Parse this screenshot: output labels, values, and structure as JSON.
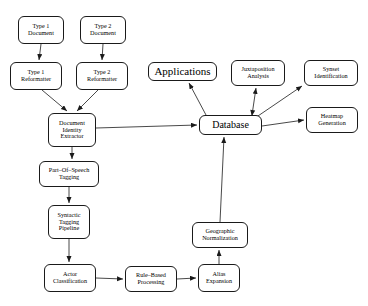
{
  "diagram": {
    "background_color": "#ffffff",
    "stroke_color": "#1a1a1a",
    "nodes": [
      {
        "id": "type1_document",
        "lines": [
          "Type 1",
          "Document"
        ],
        "x": 18,
        "y": 16,
        "w": 46,
        "h": 28,
        "size": "sm"
      },
      {
        "id": "type2_document",
        "lines": [
          "Type 2",
          "Document"
        ],
        "x": 80,
        "y": 16,
        "w": 46,
        "h": 28,
        "size": "sm"
      },
      {
        "id": "type1_reformatter",
        "lines": [
          "Type 1",
          "Reformatter"
        ],
        "x": 10,
        "y": 62,
        "w": 52,
        "h": 28,
        "size": "sm"
      },
      {
        "id": "type2_reformatter",
        "lines": [
          "Type 2",
          "Reformatter"
        ],
        "x": 76,
        "y": 62,
        "w": 52,
        "h": 28,
        "size": "sm"
      },
      {
        "id": "document_identity_extractor",
        "lines": [
          "Document",
          "Identity",
          "Extractor"
        ],
        "x": 48,
        "y": 113,
        "w": 48,
        "h": 34,
        "size": "sm"
      },
      {
        "id": "part_of_speech_tagging",
        "lines": [
          "Part–Of–Speech",
          "Tagging"
        ],
        "x": 39,
        "y": 161,
        "w": 60,
        "h": 26,
        "size": "sm"
      },
      {
        "id": "syntactic_tagging_pipeline",
        "lines": [
          "Syntactic",
          "Tagging",
          "Pipeline"
        ],
        "x": 48,
        "y": 205,
        "w": 42,
        "h": 34,
        "size": "sm"
      },
      {
        "id": "actor_classification",
        "lines": [
          "Actor",
          "Classification"
        ],
        "x": 44,
        "y": 264,
        "w": 52,
        "h": 28,
        "size": "sm"
      },
      {
        "id": "rule_based_processing",
        "lines": [
          "Rule–Based",
          "Processing"
        ],
        "x": 125,
        "y": 266,
        "w": 52,
        "h": 26,
        "size": "sm"
      },
      {
        "id": "alias_expansion",
        "lines": [
          "Alias",
          "Expansion"
        ],
        "x": 198,
        "y": 264,
        "w": 42,
        "h": 28,
        "size": "sm"
      },
      {
        "id": "geographic_normalization",
        "lines": [
          "Geographic",
          "Normalization"
        ],
        "x": 192,
        "y": 222,
        "w": 56,
        "h": 26,
        "size": "sm"
      },
      {
        "id": "applications",
        "lines": [
          "Applications"
        ],
        "x": 148,
        "y": 62,
        "w": 69,
        "h": 19,
        "size": "big"
      },
      {
        "id": "juxtaposition_analysis",
        "lines": [
          "Juxtaposition",
          "Analysis"
        ],
        "x": 231,
        "y": 60,
        "w": 54,
        "h": 26,
        "size": "sm"
      },
      {
        "id": "synset_identification",
        "lines": [
          "Synset",
          "Identification"
        ],
        "x": 304,
        "y": 60,
        "w": 54,
        "h": 26,
        "size": "sm"
      },
      {
        "id": "database",
        "lines": [
          "Database"
        ],
        "x": 199,
        "y": 115,
        "w": 63,
        "h": 20,
        "size": "mid"
      },
      {
        "id": "heatmap_generation",
        "lines": [
          "Heatmap",
          "Generation"
        ],
        "x": 306,
        "y": 107,
        "w": 52,
        "h": 26,
        "size": "sm"
      }
    ],
    "edges": [
      {
        "id": "e-type1doc-type1ref",
        "from": "type1_document",
        "to": "type1_reformatter",
        "points": "41,44 39,60",
        "arrow": "end"
      },
      {
        "id": "e-type2doc-type2ref",
        "from": "type2_document",
        "to": "type2_reformatter",
        "points": "103,44 102,60",
        "arrow": "end"
      },
      {
        "id": "e-type1ref-die",
        "from": "type1_reformatter",
        "to": "document_identity_extractor",
        "points": "42,90 67,111",
        "arrow": "end"
      },
      {
        "id": "e-type2ref-die",
        "from": "type2_reformatter",
        "to": "document_identity_extractor",
        "points": "98,90 77,111",
        "arrow": "end"
      },
      {
        "id": "e-die-database",
        "from": "document_identity_extractor",
        "to": "database",
        "points": "96,128 197,125",
        "arrow": "end"
      },
      {
        "id": "e-die-pos",
        "from": "document_identity_extractor",
        "to": "part_of_speech_tagging",
        "points": "72,147 72,159",
        "arrow": "end"
      },
      {
        "id": "e-pos-syntactic",
        "from": "part_of_speech_tagging",
        "to": "syntactic_tagging_pipeline",
        "points": "69,187 69,203",
        "arrow": "end"
      },
      {
        "id": "e-syntactic-actor",
        "from": "syntactic_tagging_pipeline",
        "to": "actor_classification",
        "points": "69,239 69,262",
        "arrow": "end"
      },
      {
        "id": "e-actor-rule",
        "from": "actor_classification",
        "to": "rule_based_processing",
        "points": "96,278 123,279",
        "arrow": "end"
      },
      {
        "id": "e-rule-alias",
        "from": "rule_based_processing",
        "to": "alias_expansion",
        "points": "177,279 196,278",
        "arrow": "end"
      },
      {
        "id": "e-alias-geo",
        "from": "alias_expansion",
        "to": "geographic_normalization",
        "points": "219,264 219,250",
        "arrow": "end"
      },
      {
        "id": "e-geo-database",
        "from": "geographic_normalization",
        "to": "database",
        "points": "220,222 224,137",
        "arrow": "end"
      },
      {
        "id": "e-database-applications",
        "from": "database",
        "to": "applications",
        "points": "206,115 189,83",
        "arrow": "end"
      },
      {
        "id": "e-database-juxtaposition",
        "from": "database",
        "to": "juxtaposition_analysis",
        "points": "252,115 256,88",
        "arrow": "both"
      },
      {
        "id": "e-database-synset",
        "from": "database",
        "to": "synset_identification",
        "points": "255,118 302,86",
        "arrow": "end"
      },
      {
        "id": "e-database-heatmap",
        "from": "database",
        "to": "heatmap_generation",
        "points": "262,126 304,120",
        "arrow": "end"
      }
    ]
  }
}
